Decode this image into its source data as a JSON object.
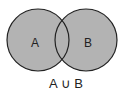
{
  "diagram": {
    "type": "venn",
    "sets": [
      {
        "label": "A",
        "fill": "#b3b3b3"
      },
      {
        "label": "B",
        "fill": "#b3b3b3"
      }
    ],
    "caption": "A ∪ B",
    "stroke": "#222222",
    "background": "#ffffff"
  }
}
